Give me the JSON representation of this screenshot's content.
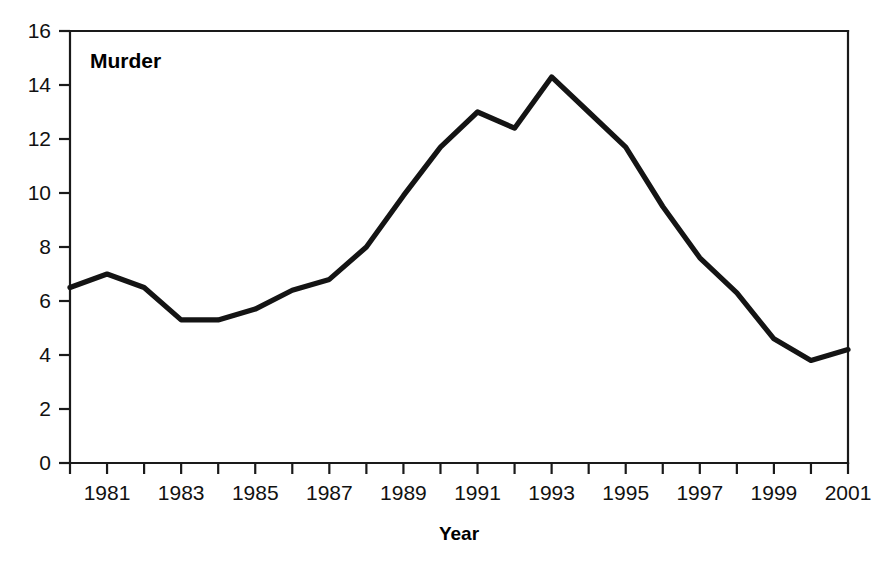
{
  "chart_data": {
    "type": "line",
    "title": "",
    "series_label": "Murder",
    "xlabel": "Year",
    "ylabel": "",
    "x": [
      1980,
      1981,
      1982,
      1983,
      1984,
      1985,
      1986,
      1987,
      1988,
      1989,
      1990,
      1991,
      1992,
      1993,
      1994,
      1995,
      1996,
      1997,
      1998,
      1999,
      2000,
      2001
    ],
    "values": [
      6.5,
      7.0,
      6.5,
      5.3,
      5.3,
      5.7,
      6.4,
      6.8,
      8.0,
      9.9,
      11.7,
      13.0,
      12.4,
      14.3,
      13.0,
      11.7,
      9.5,
      7.6,
      6.3,
      4.6,
      3.8,
      4.2
    ],
    "series": [
      {
        "name": "Murder",
        "values": [
          6.5,
          7.0,
          6.5,
          5.3,
          5.3,
          5.7,
          6.4,
          6.8,
          8.0,
          9.9,
          11.7,
          13.0,
          12.4,
          14.3,
          13.0,
          11.7,
          9.5,
          7.6,
          6.3,
          4.6,
          3.8,
          4.2
        ]
      }
    ],
    "xlim": [
      1980,
      2001
    ],
    "ylim": [
      0,
      16
    ],
    "ytick_values": [
      0,
      2,
      4,
      6,
      8,
      10,
      12,
      14,
      16
    ],
    "ytick_labels": [
      "0",
      "2",
      "4",
      "6",
      "8",
      "10",
      "12",
      "14",
      "16"
    ],
    "xtick_values": [
      1980,
      1981,
      1982,
      1983,
      1984,
      1985,
      1986,
      1987,
      1988,
      1989,
      1990,
      1991,
      1992,
      1993,
      1994,
      1995,
      1996,
      1997,
      1998,
      1999,
      2000,
      2001
    ],
    "xtick_labels_shown": [
      "1981",
      "1983",
      "1985",
      "1987",
      "1989",
      "1991",
      "1993",
      "1995",
      "1997",
      "1999",
      "2001"
    ],
    "xtick_labels_shown_values": [
      1981,
      1983,
      1985,
      1987,
      1989,
      1991,
      1993,
      1995,
      1997,
      1999,
      2001
    ],
    "grid": false,
    "legend_position": "none",
    "line_color": "#141414",
    "axis_color": "#1a1a1a",
    "background_color": "#ffffff"
  },
  "axis": {
    "x_title": "Year",
    "y_title": ""
  },
  "annotations": {
    "series_label": "Murder"
  }
}
